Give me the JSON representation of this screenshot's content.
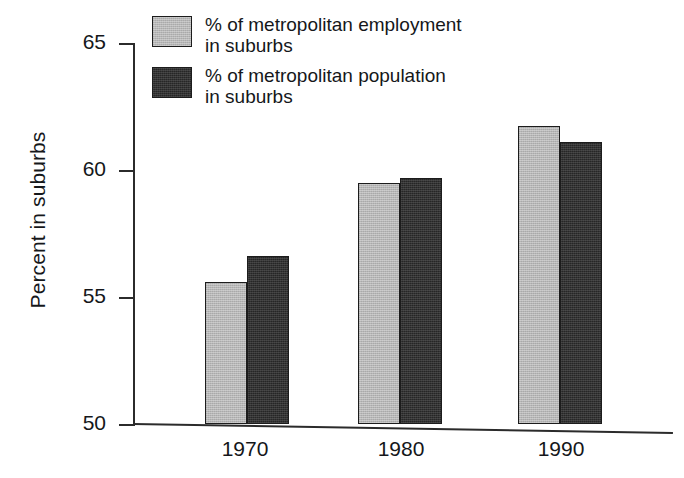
{
  "chart_data": {
    "type": "bar",
    "title": "",
    "subtitle": "",
    "xlabel": "",
    "ylabel": "Percent in suburbs",
    "categories": [
      "1970",
      "1980",
      "1990"
    ],
    "series": [
      {
        "name": "% of metropolitan employment\nin suburbs",
        "name_line1": "% of metropolitan employment",
        "name_line2": "in suburbs",
        "color": "#b6b6b6",
        "values": [
          55.6,
          59.5,
          61.75
        ]
      },
      {
        "name": "% of metropolitan population\nin suburbs",
        "name_line1": "% of metropolitan population",
        "name_line2": "in suburbs",
        "color": "#262626",
        "values": [
          56.6,
          59.7,
          61.1
        ]
      }
    ],
    "ylim": [
      50,
      65
    ],
    "yticks": [
      "50",
      "55",
      "60",
      "65"
    ],
    "ytick_values": [
      50,
      55,
      60,
      65
    ],
    "grid": false,
    "legend_position": "top-left-inside",
    "bar_outline_color": "#1c1c1c"
  },
  "axis": {
    "y_title": "Percent in suburbs",
    "ticks": [
      {
        "label": "65",
        "value": 65
      },
      {
        "label": "60",
        "value": 60
      },
      {
        "label": "55",
        "value": 55
      },
      {
        "label": "50",
        "value": 50
      }
    ],
    "x_labels": [
      "1970",
      "1980",
      "1990"
    ]
  },
  "legend": {
    "items": [
      {
        "swatch": "light-gray-swatch",
        "line1": "% of metropolitan employment",
        "line2": "in suburbs"
      },
      {
        "swatch": "dark-swatch",
        "line1": "% of metropolitan population",
        "line2": "in suburbs"
      }
    ]
  }
}
